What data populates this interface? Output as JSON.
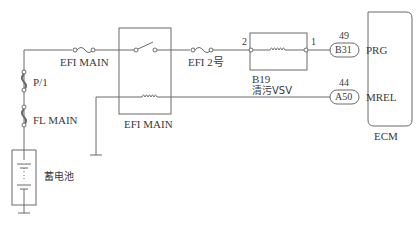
{
  "diagram": {
    "type": "wiring-diagram",
    "components": {
      "fuse_efi_main": {
        "label": "EFI MAIN"
      },
      "fuse_p1": {
        "label": "P/1"
      },
      "fuse_fl_main": {
        "label": "FL MAIN"
      },
      "battery": {
        "label": "蓄电池"
      },
      "relay_efi_main": {
        "label": "EFI MAIN"
      },
      "fuse_efi2": {
        "label": "EFI 2号"
      },
      "vsv": {
        "id": "B19",
        "label": "清污VSV",
        "pin_left": "2",
        "pin_right": "1"
      },
      "ecm": {
        "label": "ECM"
      }
    },
    "connectors": [
      {
        "code": "B31",
        "pin": "49",
        "signal": "PRG"
      },
      {
        "code": "A50",
        "pin": "44",
        "signal": "MREL"
      }
    ],
    "colors": {
      "line": "#6a6a6a",
      "text": "#3a3a3a"
    }
  }
}
